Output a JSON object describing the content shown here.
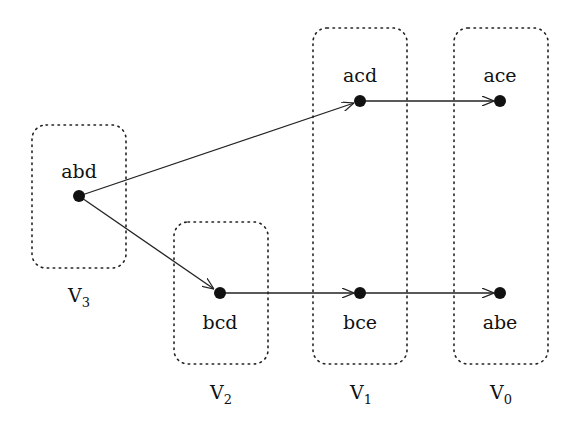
{
  "nodes": {
    "abd": {
      "label": "abd",
      "x": 79,
      "y": 196
    },
    "bcd": {
      "label": "bcd",
      "x": 220,
      "y": 293
    },
    "acd": {
      "label": "acd",
      "x": 360,
      "y": 101
    },
    "bce": {
      "label": "bce",
      "x": 360,
      "y": 293
    },
    "ace": {
      "label": "ace",
      "x": 500,
      "y": 101
    },
    "abe": {
      "label": "abe",
      "x": 500,
      "y": 293
    }
  },
  "groups": {
    "v3": {
      "label": "V",
      "sub": "3",
      "members": [
        "abd"
      ]
    },
    "v2": {
      "label": "V",
      "sub": "2",
      "members": [
        "bcd"
      ]
    },
    "v1": {
      "label": "V",
      "sub": "1",
      "members": [
        "acd",
        "bce"
      ]
    },
    "v0": {
      "label": "V",
      "sub": "0",
      "members": [
        "ace",
        "abe"
      ]
    }
  },
  "edges": [
    {
      "from": "abd",
      "to": "acd"
    },
    {
      "from": "abd",
      "to": "bcd"
    },
    {
      "from": "acd",
      "to": "ace"
    },
    {
      "from": "bcd",
      "to": "bce"
    },
    {
      "from": "bce",
      "to": "abe"
    }
  ]
}
